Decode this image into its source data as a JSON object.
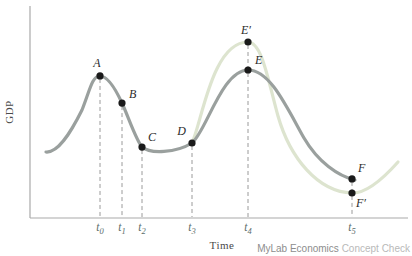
{
  "figure": {
    "ylabel": "GDP",
    "xlabel": "Time",
    "watermark": {
      "brand": "MyLab Economics",
      "suffix": "Concept Check"
    }
  },
  "colors": {
    "actual_curve": "#9aa09e",
    "alternative_curve": "#dde4cf",
    "axis": "#a9a9a9",
    "dashed_line": "#9a9a9a",
    "point_dot": "#1a1a1a",
    "tick_label": "#5d6e6c"
  },
  "chart_data": {
    "type": "line",
    "xlabel": "Time",
    "ylabel": "GDP",
    "x_ticks": [
      "t0",
      "t1",
      "t2",
      "t3",
      "t4",
      "t5"
    ],
    "y_units": "relative GDP (arbitrary index, 0-100)",
    "grid": false,
    "legend_position": "none",
    "series": [
      {
        "name": "actual-business-cycle",
        "color": "#9aa09e",
        "points": [
          {
            "label": "A",
            "t": "t0",
            "gdp": 80.7
          },
          {
            "label": "B",
            "t": "t1",
            "gdp": 65.3
          },
          {
            "label": "C",
            "t": "t2",
            "gdp": 40.3
          },
          {
            "label": "D",
            "t": "t3",
            "gdp": 42.6
          },
          {
            "label": "E",
            "t": "t4",
            "gdp": 84.1
          },
          {
            "label": "F",
            "t": "t5",
            "gdp": 22.2
          }
        ]
      },
      {
        "name": "alternative-higher-amplitude-cycle",
        "color": "#dde4cf",
        "points": [
          {
            "label": "D",
            "t": "t3",
            "gdp": 42.6
          },
          {
            "label": "E′",
            "t": "t4",
            "gdp": 100
          },
          {
            "label": "F′",
            "t": "t5",
            "gdp": 14.2
          }
        ]
      }
    ]
  }
}
